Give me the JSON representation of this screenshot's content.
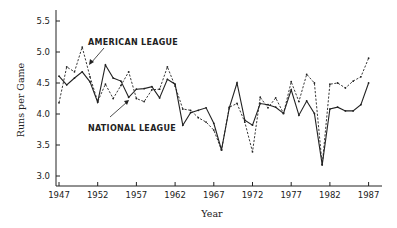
{
  "chart_data": {
    "type": "line",
    "title": "",
    "xlabel": "Year",
    "ylabel": "Runs per Game",
    "xlim": [
      1947,
      1988
    ],
    "ylim": [
      2.8,
      5.7
    ],
    "x_ticks": [
      1947,
      1952,
      1957,
      1962,
      1967,
      1972,
      1977,
      1982,
      1987
    ],
    "y_ticks": [
      3.0,
      3.5,
      4.0,
      4.5,
      5.0,
      5.5
    ],
    "y_tick_labels": [
      "3.0",
      "3.5",
      "4.0",
      "4.5",
      "5.0",
      "5.5"
    ],
    "x_tick_labels": [
      "1947",
      "1952",
      "1957",
      "1962",
      "1967",
      "1972",
      "1977",
      "1982",
      "1987"
    ],
    "grid": false,
    "legend": "inline annotations with arrows",
    "x": [
      1947,
      1948,
      1949,
      1950,
      1951,
      1952,
      1953,
      1954,
      1955,
      1956,
      1957,
      1958,
      1959,
      1960,
      1961,
      1962,
      1963,
      1964,
      1965,
      1966,
      1967,
      1968,
      1969,
      1970,
      1971,
      1972,
      1973,
      1974,
      1975,
      1976,
      1977,
      1978,
      1979,
      1980,
      1981,
      1982,
      1983,
      1984,
      1985,
      1986,
      1987
    ],
    "series": [
      {
        "name": "American League",
        "style": "dashed",
        "values": [
          4.18,
          4.76,
          4.68,
          5.08,
          4.6,
          4.2,
          4.48,
          4.25,
          4.46,
          4.68,
          4.25,
          4.2,
          4.39,
          4.4,
          4.76,
          4.45,
          4.08,
          4.06,
          3.94,
          3.87,
          3.74,
          3.42,
          4.11,
          4.17,
          3.87,
          3.39,
          4.27,
          4.1,
          4.26,
          4.01,
          4.52,
          4.2,
          4.64,
          4.5,
          3.18,
          4.48,
          4.5,
          4.42,
          4.53,
          4.6,
          4.9
        ]
      },
      {
        "name": "National League",
        "style": "solid",
        "values": [
          4.61,
          4.47,
          4.58,
          4.68,
          4.52,
          4.19,
          4.79,
          4.58,
          4.53,
          4.27,
          4.4,
          4.41,
          4.44,
          4.26,
          4.56,
          4.48,
          3.82,
          4.02,
          4.06,
          4.1,
          3.85,
          3.42,
          4.1,
          4.5,
          3.9,
          3.82,
          4.17,
          4.15,
          4.11,
          4.01,
          4.39,
          3.98,
          4.21,
          4.01,
          3.18,
          4.08,
          4.11,
          4.05,
          4.05,
          4.15,
          4.5
        ]
      }
    ],
    "annotations": [
      {
        "text": "AMERICAN LEAGUE",
        "points_to_year": 1950
      },
      {
        "text": "NATIONAL LEAGUE",
        "points_to_year": 1956
      }
    ]
  },
  "labels": {
    "xlabel": "Year",
    "ylabel": "Runs per Game",
    "american": "AMERICAN LEAGUE",
    "national": "NATIONAL LEAGUE"
  }
}
